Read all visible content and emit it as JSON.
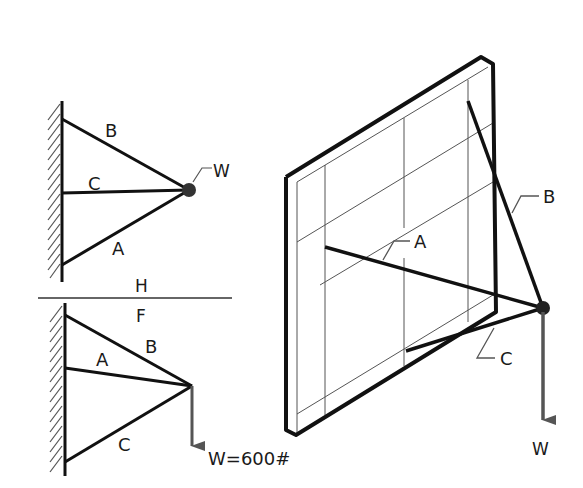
{
  "figure": {
    "top_view": {
      "title_label": "H",
      "members": [
        {
          "name": "B",
          "label": "B"
        },
        {
          "name": "C",
          "label": "C"
        },
        {
          "name": "A",
          "label": "A"
        }
      ],
      "load_label": "W"
    },
    "front_view": {
      "title_label": "F",
      "members": [
        {
          "name": "A",
          "label": "A"
        },
        {
          "name": "B",
          "label": "B"
        },
        {
          "name": "C",
          "label": "C"
        }
      ],
      "load_label": "W=600#",
      "load_value": "600",
      "load_unit": "#"
    },
    "pictorial": {
      "members": [
        {
          "name": "A",
          "label": "A"
        },
        {
          "name": "B",
          "label": "B"
        },
        {
          "name": "C",
          "label": "C"
        }
      ],
      "load_label": "W"
    },
    "colors": {
      "line": "#111111",
      "thin_line": "#555555",
      "load_arrow": "#555555",
      "hatch": "#555555",
      "background": "#ffffff"
    }
  }
}
